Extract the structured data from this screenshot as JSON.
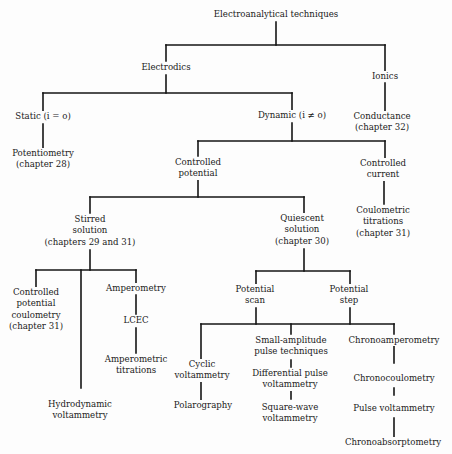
{
  "diagram": {
    "type": "tree",
    "title": "Electroanalytical techniques",
    "nodes": {
      "root": {
        "lines": [
          "Electroanalytical techniques"
        ]
      },
      "electrodics": {
        "lines": [
          "Electrodics"
        ]
      },
      "ionics": {
        "lines": [
          "Ionics"
        ]
      },
      "static": {
        "lines": [
          "Static (i = o)"
        ]
      },
      "dynamic": {
        "lines": [
          "Dynamic (i ≠ o)"
        ]
      },
      "conductance": {
        "lines": [
          "Conductance",
          "(chapter 32)"
        ]
      },
      "potentiometry": {
        "lines": [
          "Potentiometry",
          "(chapter 28)"
        ]
      },
      "controlled_potential": {
        "lines": [
          "Controlled",
          "potential"
        ]
      },
      "controlled_current": {
        "lines": [
          "Controlled",
          "current"
        ]
      },
      "coulometric_titrations": {
        "lines": [
          "Coulometric",
          "titrations",
          "(chapter 31)"
        ]
      },
      "stirred_solution": {
        "lines": [
          "Stirred",
          "solution",
          "(chapters 29 and 31)"
        ]
      },
      "quiescent_solution": {
        "lines": [
          "Quiescent",
          "solution",
          "(chapter 30)"
        ]
      },
      "controlled_potential_coulometry": {
        "lines": [
          "Controlled",
          "potential",
          "coulometry",
          "(chapter 31)"
        ]
      },
      "amperometry": {
        "lines": [
          "Amperometry"
        ]
      },
      "lcec": {
        "lines": [
          "LCEC"
        ]
      },
      "amperometric_titrations": {
        "lines": [
          "Amperometric",
          "titrations"
        ]
      },
      "hydrodynamic_voltammetry": {
        "lines": [
          "Hydrodynamic",
          "voltammetry"
        ]
      },
      "potential_scan": {
        "lines": [
          "Potential",
          "scan"
        ]
      },
      "potential_step": {
        "lines": [
          "Potential",
          "step"
        ]
      },
      "cyclic_voltammetry": {
        "lines": [
          "Cyclic",
          "voltammetry"
        ]
      },
      "polarography": {
        "lines": [
          "Polarography"
        ]
      },
      "small_amplitude_pulse": {
        "lines": [
          "Small-amplitude",
          "pulse techniques"
        ]
      },
      "differential_pulse_voltammetry": {
        "lines": [
          "Differential pulse",
          "voltammetry"
        ]
      },
      "square_wave_voltammetry": {
        "lines": [
          "Square-wave",
          "voltammetry"
        ]
      },
      "chronoamperometry": {
        "lines": [
          "Chronoamperometry"
        ]
      },
      "chronocoulometry": {
        "lines": [
          "Chronocoulometry"
        ]
      },
      "pulse_voltammetry": {
        "lines": [
          "Pulse voltammetry"
        ]
      },
      "chronoabsorptometry": {
        "lines": [
          "Chronoabsorptometry"
        ]
      }
    },
    "edges": [
      [
        "root",
        "electrodics"
      ],
      [
        "root",
        "ionics"
      ],
      [
        "electrodics",
        "static"
      ],
      [
        "electrodics",
        "dynamic"
      ],
      [
        "ionics",
        "conductance"
      ],
      [
        "static",
        "potentiometry"
      ],
      [
        "dynamic",
        "controlled_potential"
      ],
      [
        "dynamic",
        "controlled_current"
      ],
      [
        "controlled_current",
        "coulometric_titrations"
      ],
      [
        "controlled_potential",
        "stirred_solution"
      ],
      [
        "controlled_potential",
        "quiescent_solution"
      ],
      [
        "stirred_solution",
        "controlled_potential_coulometry"
      ],
      [
        "stirred_solution",
        "hydrodynamic_voltammetry"
      ],
      [
        "stirred_solution",
        "amperometry"
      ],
      [
        "amperometry",
        "lcec"
      ],
      [
        "lcec",
        "amperometric_titrations"
      ],
      [
        "quiescent_solution",
        "potential_scan"
      ],
      [
        "quiescent_solution",
        "potential_step"
      ],
      [
        "potential_scan",
        "cyclic_voltammetry"
      ],
      [
        "potential_scan",
        "small_amplitude_pulse"
      ],
      [
        "potential_scan",
        "chronoamperometry"
      ],
      [
        "potential_step",
        "cyclic_voltammetry"
      ],
      [
        "potential_step",
        "small_amplitude_pulse"
      ],
      [
        "potential_step",
        "chronoamperometry"
      ],
      [
        "cyclic_voltammetry",
        "polarography"
      ],
      [
        "small_amplitude_pulse",
        "differential_pulse_voltammetry"
      ],
      [
        "differential_pulse_voltammetry",
        "square_wave_voltammetry"
      ],
      [
        "chronoamperometry",
        "chronocoulometry"
      ],
      [
        "chronocoulometry",
        "pulse_voltammetry"
      ],
      [
        "pulse_voltammetry",
        "chronoabsorptometry"
      ]
    ]
  }
}
